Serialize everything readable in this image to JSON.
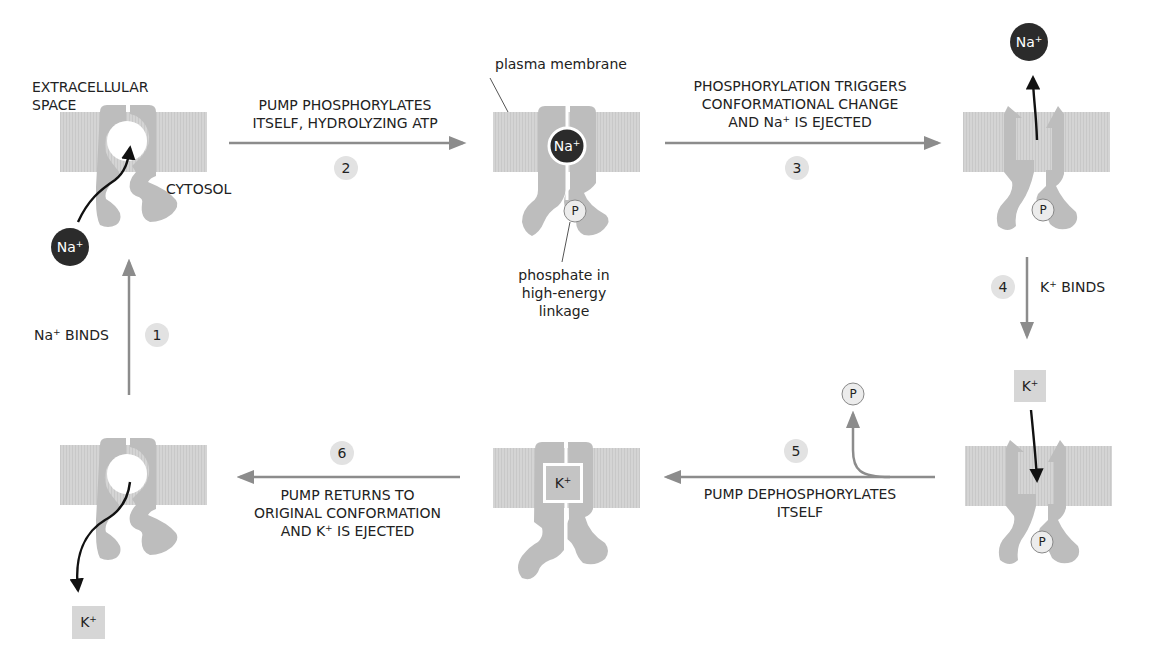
{
  "colors": {
    "membrane": "#d2d2d2",
    "protein": "#bdbdbd",
    "arrow": "#8c8c8c",
    "ion_na": "#2b2b2b",
    "ion_k_box": "#d6d6d6",
    "step_badge": "#e2e2e2",
    "text": "#222222"
  },
  "labels": {
    "extracellular_line1": "EXTRACELLULAR",
    "extracellular_line2": "SPACE",
    "cytosol": "CYTOSOL",
    "plasma_membrane": "plasma membrane",
    "phosphate_line1": "phosphate in",
    "phosphate_line2": "high-energy",
    "phosphate_line3": "linkage"
  },
  "ions": {
    "na": "Na",
    "k": "K",
    "charge": "+",
    "phosphate": "P"
  },
  "steps": [
    {
      "number": "1",
      "text_before": "Na",
      "sup": "+",
      "text_after": " BINDS"
    },
    {
      "number": "2",
      "line1": "PUMP PHOSPHORYLATES",
      "line2": "ITSELF, HYDROLYZING ATP"
    },
    {
      "number": "3",
      "line1": "PHOSPHORYLATION TRIGGERS",
      "line2": "CONFORMATIONAL CHANGE",
      "line3_before": "AND Na",
      "line3_sup": "+",
      "line3_after": " IS EJECTED"
    },
    {
      "number": "4",
      "text_before": "K",
      "sup": "+",
      "text_after": " BINDS"
    },
    {
      "number": "5",
      "line1": "PUMP DEPHOSPHORYLATES",
      "line2": "ITSELF"
    },
    {
      "number": "6",
      "line1": "PUMP RETURNS TO",
      "line2": "ORIGINAL CONFORMATION",
      "line3_before": "AND K",
      "line3_sup": "+",
      "line3_after": " IS EJECTED"
    }
  ]
}
